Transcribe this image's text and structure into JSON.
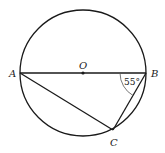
{
  "diagram": {
    "type": "geometry-circle-inscribed-triangle",
    "circle": {
      "center": "O",
      "cx": 83,
      "cy": 73,
      "r": 63
    },
    "points": {
      "A": {
        "label": "A",
        "x": 20,
        "y": 73
      },
      "B": {
        "label": "B",
        "x": 146,
        "y": 73
      },
      "C": {
        "label": "C",
        "x": 113,
        "y": 130
      },
      "O": {
        "label": "O",
        "x": 83,
        "y": 73
      }
    },
    "segments": [
      "AB",
      "AC",
      "BC"
    ],
    "angle": {
      "vertex": "B",
      "between": [
        "BA",
        "BC"
      ],
      "label": "55°"
    },
    "colors": {
      "stroke": "#1a1a1a",
      "angle_arc": "#555555",
      "background": "#ffffff"
    }
  }
}
